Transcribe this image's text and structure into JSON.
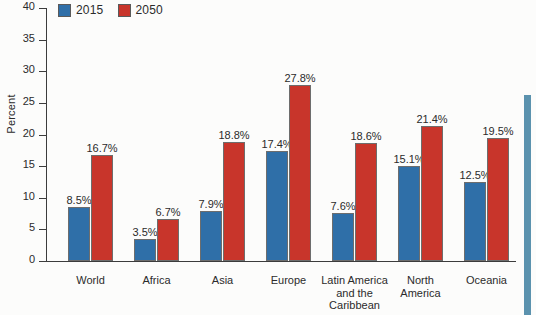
{
  "chart_data": {
    "type": "bar",
    "title": "",
    "xlabel": "",
    "ylabel": "Percent",
    "ylim": [
      0,
      40
    ],
    "yticks": [
      "0",
      "5",
      "10",
      "15",
      "20",
      "25",
      "30",
      "35",
      "40"
    ],
    "grid": false,
    "legend_position": "top-left",
    "value_suffix": "%",
    "categories": [
      "World",
      "Africa",
      "Asia",
      "Europe",
      "Latin America\nand the\nCaribbean",
      "North\nAmerica",
      "Oceania"
    ],
    "series": [
      {
        "name": "2015",
        "color": "#2f6fa8",
        "values": [
          8.5,
          3.5,
          7.9,
          17.4,
          7.6,
          15.1,
          12.5
        ],
        "labels": [
          "8.5%",
          "3.5%",
          "7.9%",
          "17.4%",
          "7.6%",
          "15.1%",
          "12.5%"
        ]
      },
      {
        "name": "2050",
        "color": "#c8352b",
        "values": [
          16.7,
          6.7,
          18.8,
          27.8,
          18.6,
          21.4,
          19.5
        ],
        "labels": [
          "16.7%",
          "6.7%",
          "18.8%",
          "27.8%",
          "18.6%",
          "21.4%",
          "19.5%"
        ]
      }
    ]
  },
  "decoration": {
    "edge_bar_color": "#5b92ae"
  }
}
